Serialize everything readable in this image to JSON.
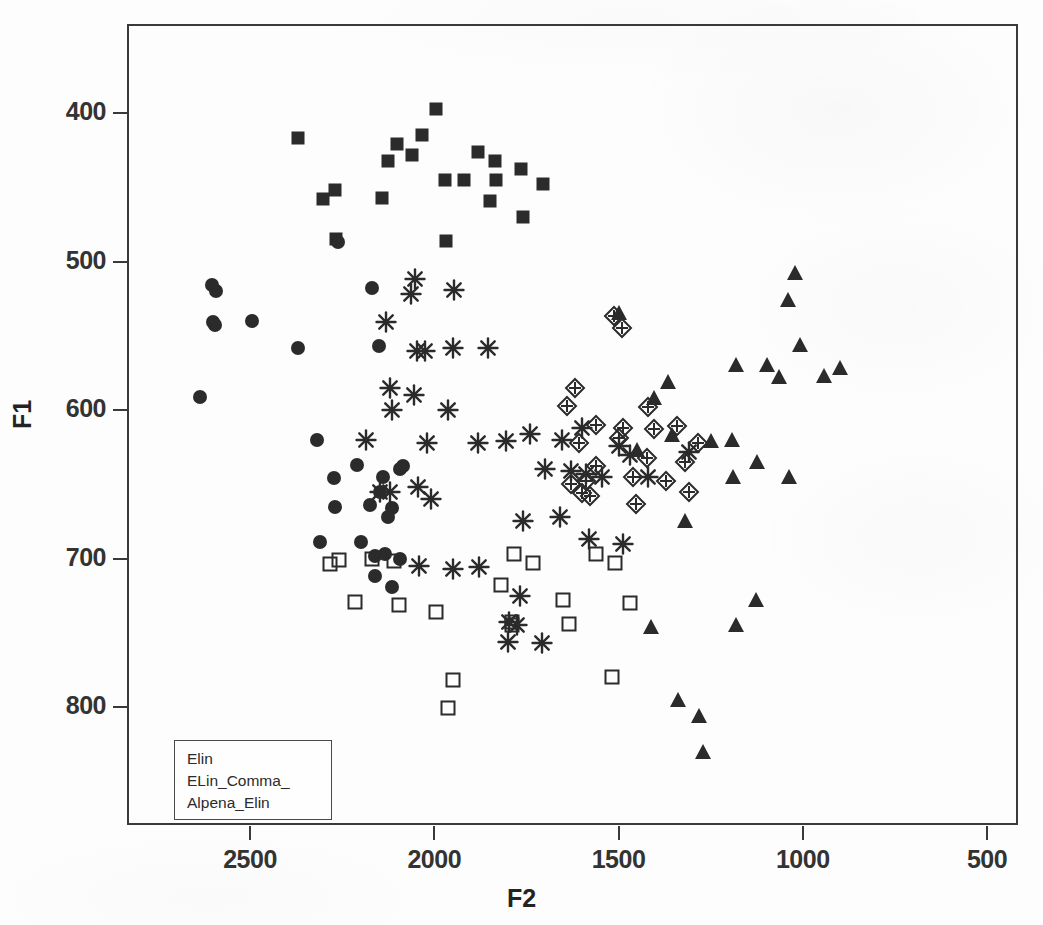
{
  "chart_data": {
    "type": "scatter",
    "title": "",
    "xlabel": "F2",
    "ylabel": "F1",
    "xticks": [
      2500,
      2000,
      1500,
      1000,
      500
    ],
    "yticks": [
      400,
      500,
      600,
      700,
      800
    ],
    "xlim": [
      2780,
      430
    ],
    "ylim": [
      845,
      350
    ],
    "x_axis_reversed": true,
    "y_axis_reversed": true,
    "grid": false,
    "legend_position": "bottom-left",
    "legend_entries": [
      "Elin",
      "ELin_Comma_",
      "Alpena_Elin"
    ],
    "series": [
      {
        "name": "filled-square",
        "marker": "filled-square",
        "points": [
          [
            1996,
            397
          ],
          [
            2034,
            415
          ],
          [
            2100,
            421
          ],
          [
            2060,
            428
          ],
          [
            1882,
            426
          ],
          [
            1834,
            432
          ],
          [
            1919,
            445
          ],
          [
            2126,
            432
          ],
          [
            1765,
            438
          ],
          [
            2370,
            417
          ],
          [
            1971,
            445
          ],
          [
            2302,
            458
          ],
          [
            1848,
            459
          ],
          [
            1832,
            445
          ],
          [
            2268,
            452
          ],
          [
            1705,
            448
          ],
          [
            2143,
            457
          ],
          [
            1760,
            470
          ],
          [
            1967,
            486
          ],
          [
            2266,
            485
          ]
        ]
      },
      {
        "name": "filled-circle",
        "marker": "filled-circle",
        "points": [
          [
            2592,
            520
          ],
          [
            2262,
            487
          ],
          [
            2170,
            518
          ],
          [
            2602,
            516
          ],
          [
            2594,
            543
          ],
          [
            2600,
            541
          ],
          [
            2494,
            540
          ],
          [
            2636,
            591
          ],
          [
            2150,
            557
          ],
          [
            2370,
            558
          ],
          [
            2318,
            620
          ],
          [
            2272,
            646
          ],
          [
            2268,
            665
          ],
          [
            2094,
            640
          ],
          [
            2085,
            638
          ],
          [
            2138,
            645
          ],
          [
            2146,
            655
          ],
          [
            2210,
            637
          ],
          [
            2115,
            666
          ],
          [
            2175,
            664
          ],
          [
            2126,
            672
          ],
          [
            2310,
            689
          ],
          [
            2198,
            689
          ],
          [
            2134,
            697
          ],
          [
            2160,
            698
          ],
          [
            2093,
            700
          ],
          [
            2162,
            712
          ],
          [
            2116,
            719
          ]
        ]
      },
      {
        "name": "asterisk",
        "marker": "asterisk",
        "points": [
          [
            2052,
            512
          ],
          [
            2064,
            522
          ],
          [
            1946,
            519
          ],
          [
            2132,
            541
          ],
          [
            2048,
            560
          ],
          [
            2025,
            560
          ],
          [
            1950,
            558
          ],
          [
            1853,
            558
          ],
          [
            2120,
            585
          ],
          [
            2056,
            590
          ],
          [
            1962,
            600
          ],
          [
            2114,
            600
          ],
          [
            2186,
            620
          ],
          [
            2020,
            622
          ],
          [
            1880,
            622
          ],
          [
            1805,
            621
          ],
          [
            1740,
            616
          ],
          [
            1654,
            620
          ],
          [
            1600,
            612
          ],
          [
            1500,
            624
          ],
          [
            1470,
            630
          ],
          [
            1700,
            640
          ],
          [
            1630,
            641
          ],
          [
            1545,
            645
          ],
          [
            1420,
            645
          ],
          [
            1588,
            643
          ],
          [
            2148,
            655
          ],
          [
            2120,
            655
          ],
          [
            2043,
            652
          ],
          [
            2010,
            660
          ],
          [
            1760,
            675
          ],
          [
            1658,
            672
          ],
          [
            1580,
            687
          ],
          [
            1488,
            690
          ],
          [
            1310,
            628
          ],
          [
            2042,
            705
          ],
          [
            1950,
            707
          ],
          [
            1878,
            706
          ],
          [
            1766,
            725
          ],
          [
            1798,
            743
          ],
          [
            1775,
            745
          ],
          [
            1800,
            756
          ],
          [
            1707,
            757
          ]
        ]
      },
      {
        "name": "diamond-cross",
        "marker": "diamond-cross",
        "points": [
          [
            1512,
            537
          ],
          [
            1490,
            545
          ],
          [
            1618,
            585
          ],
          [
            1640,
            597
          ],
          [
            1419,
            598
          ],
          [
            1340,
            611
          ],
          [
            1562,
            610
          ],
          [
            1488,
            612
          ],
          [
            1405,
            613
          ],
          [
            1500,
            619
          ],
          [
            1607,
            622
          ],
          [
            1424,
            632
          ],
          [
            1320,
            635
          ],
          [
            1560,
            638
          ],
          [
            1460,
            645
          ],
          [
            1370,
            648
          ],
          [
            1630,
            650
          ],
          [
            1588,
            648
          ],
          [
            1310,
            655
          ],
          [
            1452,
            663
          ],
          [
            1600,
            656
          ],
          [
            1578,
            658
          ],
          [
            1283,
            622
          ]
        ]
      },
      {
        "name": "filled-triangle",
        "marker": "filled-triangle",
        "points": [
          [
            1020,
            508
          ],
          [
            1040,
            526
          ],
          [
            1500,
            535
          ],
          [
            1008,
            556
          ],
          [
            1180,
            570
          ],
          [
            1096,
            570
          ],
          [
            1065,
            578
          ],
          [
            943,
            577
          ],
          [
            900,
            572
          ],
          [
            1367,
            581
          ],
          [
            1404,
            592
          ],
          [
            1354,
            617
          ],
          [
            1450,
            627
          ],
          [
            1250,
            621
          ],
          [
            1192,
            620
          ],
          [
            1125,
            635
          ],
          [
            1188,
            645
          ],
          [
            1038,
            645
          ],
          [
            1320,
            675
          ],
          [
            1128,
            728
          ],
          [
            1180,
            745
          ],
          [
            1413,
            746
          ],
          [
            1338,
            795
          ],
          [
            1282,
            806
          ],
          [
            1270,
            830
          ]
        ]
      },
      {
        "name": "open-square",
        "marker": "open-square",
        "points": [
          [
            2283,
            704
          ],
          [
            2258,
            701
          ],
          [
            2170,
            700
          ],
          [
            2108,
            702
          ],
          [
            1784,
            697
          ],
          [
            1732,
            703
          ],
          [
            1560,
            697
          ],
          [
            1510,
            703
          ],
          [
            2214,
            729
          ],
          [
            2095,
            731
          ],
          [
            1996,
            736
          ],
          [
            1820,
            718
          ],
          [
            1650,
            728
          ],
          [
            1468,
            730
          ],
          [
            1790,
            743
          ],
          [
            1788,
            745
          ],
          [
            1635,
            744
          ],
          [
            1950,
            782
          ],
          [
            1518,
            780
          ],
          [
            1963,
            801
          ]
        ]
      }
    ]
  },
  "legend": {
    "items": [
      {
        "label": "Elin"
      },
      {
        "label": "ELin_Comma_"
      },
      {
        "label": "Alpena_Elin"
      }
    ]
  },
  "axes": {
    "x": {
      "title": "F2",
      "tick_labels": [
        "2500",
        "2000",
        "1500",
        "1000",
        "500"
      ]
    },
    "y": {
      "title": "F1",
      "tick_labels": [
        "400",
        "500",
        "600",
        "700",
        "800"
      ]
    }
  },
  "colors": {
    "marker": "#2b2b2b",
    "axis": "#3a3a3a",
    "background": "#fdfdfd",
    "text": "#232323"
  }
}
